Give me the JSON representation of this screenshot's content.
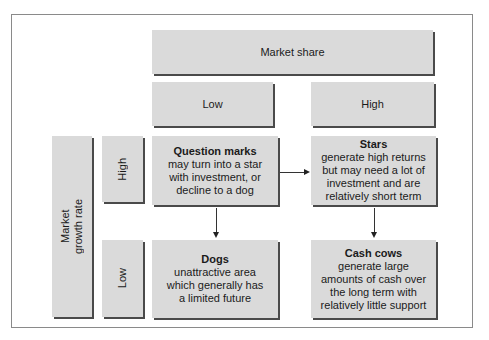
{
  "axes": {
    "x_title": "Market share",
    "x_low": "Low",
    "x_high": "High",
    "y_title_line1": "Market",
    "y_title_line2": "growth rate",
    "y_high": "High",
    "y_low": "Low"
  },
  "quadrants": {
    "question_marks": {
      "title": "Question marks",
      "desc": [
        "may turn into a star",
        "with investment, or",
        "decline to a dog"
      ]
    },
    "stars": {
      "title": "Stars",
      "desc": [
        "generate high returns",
        "but may need a lot of",
        "investment and are",
        "relatively short term"
      ]
    },
    "dogs": {
      "title": "Dogs",
      "desc": [
        "unattractive area",
        "which generally has",
        "a limited future"
      ]
    },
    "cash_cows": {
      "title": "Cash cows",
      "desc": [
        "generate large",
        "amounts of cash over",
        "the long term with",
        "relatively little support"
      ]
    }
  },
  "arrows": [
    {
      "from": "Question marks",
      "to": "Stars"
    },
    {
      "from": "Question marks",
      "to": "Dogs"
    },
    {
      "from": "Stars",
      "to": "Cash cows"
    }
  ],
  "colors": {
    "box_fill": "#dadada",
    "box_shadow": "#4a4a4a",
    "frame": "#8a8a8a"
  }
}
